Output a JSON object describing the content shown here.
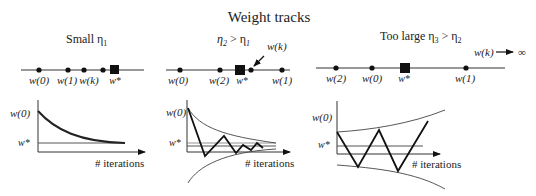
{
  "title": "Weight tracks",
  "panels": [
    {
      "label": "Small η",
      "label_sub": "1",
      "label_extra": "",
      "track": {
        "points": [
          {
            "label": "w(0)"
          },
          {
            "label": "w(1)"
          },
          {
            "label": "w(k)"
          },
          {
            "label": ""
          }
        ],
        "optimum_label": "w*"
      },
      "plot": {
        "y_labels": [
          "w(0)",
          "w*"
        ],
        "x_label": "# iterations",
        "behavior": "monotonic convergence"
      }
    },
    {
      "label": "η",
      "label_sub": "2",
      "label_rel": " > η",
      "label_rel_sub": "1",
      "track": {
        "points": [
          {
            "label": "w(0)"
          },
          {
            "label": "w(2)"
          },
          {
            "label": "w(k)"
          },
          {
            "label": "w(1)"
          }
        ],
        "optimum_label": "w*",
        "callout": "w(k)"
      },
      "plot": {
        "y_labels": [
          "w(0)",
          "w*"
        ],
        "x_label": "# iterations",
        "behavior": "damped oscillation"
      }
    },
    {
      "label": "Too large η",
      "label_sub": "3",
      "label_rel": " > η",
      "label_rel_sub": "2",
      "track": {
        "points": [
          {
            "label": "w(2)"
          },
          {
            "label": "w(0)"
          },
          {
            "label": "w(1)"
          }
        ],
        "optimum_label": "w*",
        "divergence_label": "w(k)",
        "divergence_target": "∞"
      },
      "plot": {
        "y_labels": [
          "w(0)",
          "w*"
        ],
        "x_label": "# iterations",
        "behavior": "divergent oscillation"
      }
    }
  ]
}
